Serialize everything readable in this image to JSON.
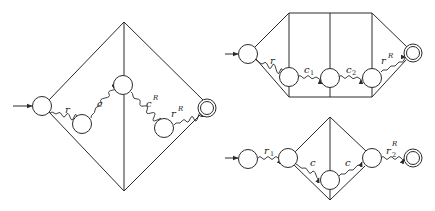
{
  "diagrams": [
    {
      "id": "left-diamond",
      "states": [
        "start",
        "q1",
        "q2",
        "q3",
        "accept"
      ],
      "labels": {
        "r": "r",
        "c": "c",
        "cR_base": "c",
        "cR_sup": "R",
        "rR_base": "r",
        "rR_sup": "R"
      }
    },
    {
      "id": "top-right-hexagon",
      "states": [
        "start",
        "q1",
        "q2",
        "q3",
        "accept"
      ],
      "labels": {
        "r": "r",
        "c1_base": "c",
        "c1_sub": "1",
        "c2_base": "c",
        "c2_sub": "2",
        "rR_base": "r",
        "rR_sup": "R"
      }
    },
    {
      "id": "bottom-right-diamond",
      "states": [
        "start",
        "q1",
        "q2",
        "q3",
        "accept"
      ],
      "labels": {
        "r1_base": "r",
        "r1_sub": "1",
        "c_left": "c",
        "c_right": "c",
        "r2R_base": "r",
        "r2R_sub": "2",
        "r2R_sup": "R"
      }
    }
  ],
  "colors": {
    "stroke": "#2a2a2a",
    "background": "#ffffff"
  }
}
